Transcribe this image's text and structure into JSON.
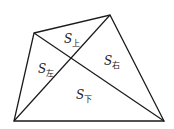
{
  "diagram": {
    "type": "quadrilateral-with-diagonals",
    "vertices": {
      "A": [
        34,
        33
      ],
      "B": [
        110,
        15
      ],
      "C": [
        164,
        121
      ],
      "D": [
        14,
        121
      ]
    },
    "intersection": [
      71,
      59
    ],
    "regions": [
      {
        "id": "top",
        "symbol": "S",
        "subscript": "上",
        "pos": [
          64,
          33
        ]
      },
      {
        "id": "left",
        "symbol": "S",
        "subscript": "左",
        "pos": [
          38,
          63
        ]
      },
      {
        "id": "right",
        "symbol": "S",
        "subscript": "右",
        "pos": [
          104,
          55
        ]
      },
      {
        "id": "bottom",
        "symbol": "S",
        "subscript": "下",
        "pos": [
          76,
          89
        ]
      }
    ],
    "stroke_color": "#1a1a1a"
  }
}
